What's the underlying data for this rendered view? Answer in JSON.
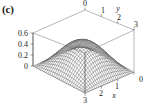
{
  "figure": {
    "panel_label": "(c)",
    "background_color": "#ffffff",
    "line_color": "#4a4a4a",
    "box_color": "#6e6e6e"
  },
  "chart_data": {
    "type": "surface",
    "title": "(c)",
    "projection": "3d-mesh-wireframe",
    "xlabel": "x",
    "ylabel": "y",
    "zlabel": "",
    "xlim": [
      0,
      3
    ],
    "ylim": [
      0,
      3
    ],
    "zlim": [
      0,
      0.6
    ],
    "x_ticks": [
      0,
      1,
      2,
      3
    ],
    "x_tick_labels": [
      "0",
      "1",
      "2",
      "3"
    ],
    "y_ticks": [
      0,
      1,
      2,
      3
    ],
    "y_tick_labels": [
      "0",
      "1",
      "2",
      "3"
    ],
    "z_ticks": [
      0,
      0.2,
      0.4,
      0.6
    ],
    "z_tick_labels": [
      "0",
      "0.2",
      "0.4",
      "0.6"
    ],
    "grid": false,
    "legend": false,
    "surface_description": "single central peak over square domain, zero at all four edges",
    "peak_value": 0.5,
    "peak_location": [
      1.5,
      1.5
    ],
    "mesh_divisions": 28,
    "x": [
      0,
      0.375,
      0.75,
      1.125,
      1.5,
      1.875,
      2.25,
      2.625,
      3
    ],
    "y": [
      0,
      0.375,
      0.75,
      1.125,
      1.5,
      1.875,
      2.25,
      2.625,
      3
    ],
    "z": [
      [
        0,
        0,
        0,
        0,
        0,
        0,
        0,
        0,
        0
      ],
      [
        0,
        0.073,
        0.135,
        0.176,
        0.191,
        0.176,
        0.135,
        0.073,
        0
      ],
      [
        0,
        0.135,
        0.25,
        0.327,
        0.354,
        0.327,
        0.25,
        0.135,
        0
      ],
      [
        0,
        0.176,
        0.327,
        0.427,
        0.462,
        0.427,
        0.327,
        0.176,
        0
      ],
      [
        0,
        0.191,
        0.354,
        0.462,
        0.5,
        0.462,
        0.354,
        0.191,
        0
      ],
      [
        0,
        0.176,
        0.327,
        0.427,
        0.462,
        0.427,
        0.327,
        0.176,
        0
      ],
      [
        0,
        0.135,
        0.25,
        0.327,
        0.354,
        0.327,
        0.25,
        0.135,
        0
      ],
      [
        0,
        0.073,
        0.135,
        0.176,
        0.191,
        0.176,
        0.135,
        0.073,
        0
      ],
      [
        0,
        0,
        0,
        0,
        0,
        0,
        0,
        0,
        0
      ]
    ]
  },
  "axes": {
    "z_axis": {
      "name": "z-axis",
      "labels": [
        "0.6",
        "0.4",
        "0.2",
        "0"
      ]
    },
    "y_axis": {
      "name": "y-axis",
      "title": "y",
      "labels": [
        "0",
        "1",
        "2",
        "3"
      ]
    },
    "x_axis": {
      "name": "x-axis",
      "title": "x",
      "labels": [
        "3",
        "2",
        "1",
        "0"
      ]
    }
  }
}
